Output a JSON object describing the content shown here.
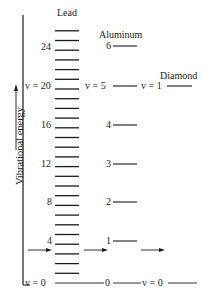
{
  "diagram": {
    "y_axis_label": "Vibrational energy",
    "columns": [
      {
        "name": "Lead",
        "levels_shown": 27,
        "labeled_levels": [
          "24",
          "20",
          "16",
          "12",
          "8",
          "4",
          "0"
        ],
        "prefix_label": "v = "
      },
      {
        "name": "Aluminum",
        "labeled_levels": [
          "6",
          "5",
          "4",
          "3",
          "2",
          "1",
          "0"
        ],
        "prefix_label": "v = "
      },
      {
        "name": "Diamond",
        "labeled_levels": [
          "1",
          "0"
        ],
        "prefix_label": "v = "
      }
    ],
    "labels": {
      "lead_title": "Lead",
      "aluminum_title": "Aluminum",
      "diamond_title": "Diamond",
      "lead_24": "24",
      "lead_20": "v = 20",
      "lead_16": "16",
      "lead_12": "12",
      "lead_8": "8",
      "lead_4": "4",
      "lead_0": "v = 0",
      "al_6": "6",
      "al_5": "v = 5",
      "al_4": "4",
      "al_3": "3",
      "al_2": "2",
      "al_1": "1",
      "al_0": "0",
      "dia_1": "v = 1",
      "dia_0": "v = 0"
    },
    "colors": {
      "ink": "#1a1a1a",
      "background": "#ffffff"
    }
  }
}
